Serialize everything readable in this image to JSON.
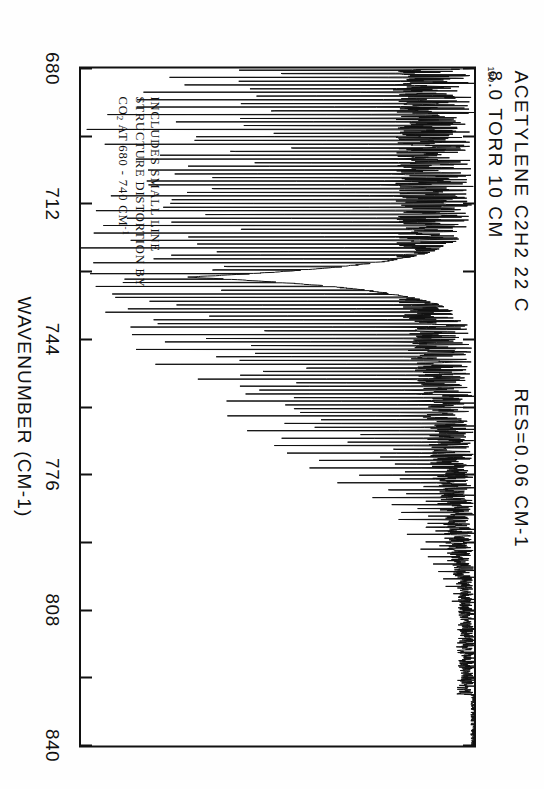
{
  "figure": {
    "kind": "infrared-absorption-spectrum",
    "orientation_degrees": 90,
    "ink_color": "#111111",
    "paper_color": "#fefefe"
  },
  "header": {
    "line1": "ACETYLENE  C2H2    22 C",
    "line2": "8.0 TORR  10 CM",
    "resolution": "RES=0.06 CM-1",
    "ymax_label": "130"
  },
  "annotation": {
    "line1": "INCLUDES SMALL LINE",
    "line2": "STRUCTURE DISTORTION BY",
    "line3_pre": "CO",
    "line3_sub": "2",
    "line3_mid": " AT 680 - 740 CM",
    "line3_sup": "-1"
  },
  "axis": {
    "title": "WAVENUMBER  (CM-1)",
    "tick_labels": [
      "680",
      "712",
      "744",
      "776",
      "808",
      "840"
    ]
  },
  "chart_data": {
    "type": "line",
    "title": "ACETYLENE  C2H2    22 C",
    "subtitle": "8.0 TORR  10 CM   RES=0.06 CM-1",
    "xlabel": "WAVENUMBER  (CM-1)",
    "ylabel": "",
    "xlim": [
      680,
      840
    ],
    "ylim": [
      0,
      130
    ],
    "xticks": [
      680,
      696,
      712,
      728,
      744,
      760,
      776,
      792,
      808,
      824,
      840
    ],
    "xtick_labels": [
      "680",
      "",
      "712",
      "",
      "744",
      "",
      "776",
      "",
      "808",
      "",
      "840"
    ],
    "grid": false,
    "legend": null,
    "baseline_value": 130,
    "features": [
      {
        "name": "P-branch manifold",
        "range": [
          680,
          727
        ],
        "description": "dense series of strong downward lines, many reaching near zero"
      },
      {
        "name": "Q-branch",
        "center": 729.0,
        "description": "very intense saturated band head reaching full absorption"
      },
      {
        "name": "R-branch manifold",
        "range": [
          731,
          800
        ],
        "description": "dense series of lines decaying in strength with wavenumber"
      },
      {
        "name": "weak high-J lines",
        "range": [
          800,
          830
        ],
        "description": "sparse weak lines on baseline"
      }
    ],
    "series": [
      {
        "name": "transmission",
        "x_start": 680,
        "x_end": 840,
        "n_points": 1600,
        "baseline": 130,
        "peaks": [
          {
            "x": 680.4,
            "depth": 118
          },
          {
            "x": 681.2,
            "depth": 96
          },
          {
            "x": 682.1,
            "depth": 104
          },
          {
            "x": 683.0,
            "depth": 88
          },
          {
            "x": 683.9,
            "depth": 122
          },
          {
            "x": 684.8,
            "depth": 75
          },
          {
            "x": 685.6,
            "depth": 110
          },
          {
            "x": 686.5,
            "depth": 92
          },
          {
            "x": 687.4,
            "depth": 126
          },
          {
            "x": 688.3,
            "depth": 80
          },
          {
            "x": 689.1,
            "depth": 115
          },
          {
            "x": 690.0,
            "depth": 100
          },
          {
            "x": 690.9,
            "depth": 124
          },
          {
            "x": 691.8,
            "depth": 86
          },
          {
            "x": 692.6,
            "depth": 112
          },
          {
            "x": 693.5,
            "depth": 98
          },
          {
            "x": 694.4,
            "depth": 128
          },
          {
            "x": 695.3,
            "depth": 84
          },
          {
            "x": 696.1,
            "depth": 118
          },
          {
            "x": 697.0,
            "depth": 103
          },
          {
            "x": 697.9,
            "depth": 125
          },
          {
            "x": 698.8,
            "depth": 90
          },
          {
            "x": 699.6,
            "depth": 120
          },
          {
            "x": 700.5,
            "depth": 106
          },
          {
            "x": 701.4,
            "depth": 127
          },
          {
            "x": 702.3,
            "depth": 94
          },
          {
            "x": 703.1,
            "depth": 121
          },
          {
            "x": 704.0,
            "depth": 108
          },
          {
            "x": 704.9,
            "depth": 128
          },
          {
            "x": 705.8,
            "depth": 97
          },
          {
            "x": 706.6,
            "depth": 123
          },
          {
            "x": 707.5,
            "depth": 110
          },
          {
            "x": 708.4,
            "depth": 129
          },
          {
            "x": 709.3,
            "depth": 99
          },
          {
            "x": 710.1,
            "depth": 124
          },
          {
            "x": 711.0,
            "depth": 112
          },
          {
            "x": 711.9,
            "depth": 129
          },
          {
            "x": 712.8,
            "depth": 102
          },
          {
            "x": 713.6,
            "depth": 125
          },
          {
            "x": 714.5,
            "depth": 114
          },
          {
            "x": 715.4,
            "depth": 130
          },
          {
            "x": 716.3,
            "depth": 104
          },
          {
            "x": 717.1,
            "depth": 126
          },
          {
            "x": 718.0,
            "depth": 116
          },
          {
            "x": 718.9,
            "depth": 130
          },
          {
            "x": 719.8,
            "depth": 106
          },
          {
            "x": 720.6,
            "depth": 127
          },
          {
            "x": 721.5,
            "depth": 118
          },
          {
            "x": 722.4,
            "depth": 130
          },
          {
            "x": 723.3,
            "depth": 108
          },
          {
            "x": 724.1,
            "depth": 128
          },
          {
            "x": 725.0,
            "depth": 120
          },
          {
            "x": 725.9,
            "depth": 130
          },
          {
            "x": 726.8,
            "depth": 124
          },
          {
            "x": 727.6,
            "depth": 130
          },
          {
            "x": 728.5,
            "depth": 130
          },
          {
            "x": 729.2,
            "depth": 130
          },
          {
            "x": 729.8,
            "depth": 130
          },
          {
            "x": 730.6,
            "depth": 130
          },
          {
            "x": 731.5,
            "depth": 128
          },
          {
            "x": 732.4,
            "depth": 126
          },
          {
            "x": 733.3,
            "depth": 124
          },
          {
            "x": 734.1,
            "depth": 122
          },
          {
            "x": 735.0,
            "depth": 120
          },
          {
            "x": 735.9,
            "depth": 125
          },
          {
            "x": 736.8,
            "depth": 115
          },
          {
            "x": 737.6,
            "depth": 122
          },
          {
            "x": 738.5,
            "depth": 112
          },
          {
            "x": 739.4,
            "depth": 120
          },
          {
            "x": 740.3,
            "depth": 108
          },
          {
            "x": 741.1,
            "depth": 118
          },
          {
            "x": 742.0,
            "depth": 104
          },
          {
            "x": 742.9,
            "depth": 116
          },
          {
            "x": 743.8,
            "depth": 100
          },
          {
            "x": 744.6,
            "depth": 114
          },
          {
            "x": 745.5,
            "depth": 96
          },
          {
            "x": 746.4,
            "depth": 112
          },
          {
            "x": 747.3,
            "depth": 92
          },
          {
            "x": 748.1,
            "depth": 110
          },
          {
            "x": 749.0,
            "depth": 88
          },
          {
            "x": 749.9,
            "depth": 108
          },
          {
            "x": 750.8,
            "depth": 84
          },
          {
            "x": 751.6,
            "depth": 105
          },
          {
            "x": 752.5,
            "depth": 80
          },
          {
            "x": 753.4,
            "depth": 102
          },
          {
            "x": 754.3,
            "depth": 76
          },
          {
            "x": 755.1,
            "depth": 99
          },
          {
            "x": 756.0,
            "depth": 72
          },
          {
            "x": 756.9,
            "depth": 96
          },
          {
            "x": 757.8,
            "depth": 68
          },
          {
            "x": 758.6,
            "depth": 92
          },
          {
            "x": 759.5,
            "depth": 64
          },
          {
            "x": 760.4,
            "depth": 88
          },
          {
            "x": 761.3,
            "depth": 60
          },
          {
            "x": 762.1,
            "depth": 84
          },
          {
            "x": 763.0,
            "depth": 56
          },
          {
            "x": 763.9,
            "depth": 80
          },
          {
            "x": 764.8,
            "depth": 52
          },
          {
            "x": 765.6,
            "depth": 76
          },
          {
            "x": 766.5,
            "depth": 48
          },
          {
            "x": 767.4,
            "depth": 72
          },
          {
            "x": 768.3,
            "depth": 44
          },
          {
            "x": 769.1,
            "depth": 68
          },
          {
            "x": 770.0,
            "depth": 40
          },
          {
            "x": 770.9,
            "depth": 64
          },
          {
            "x": 771.8,
            "depth": 36
          },
          {
            "x": 772.6,
            "depth": 58
          },
          {
            "x": 773.5,
            "depth": 33
          },
          {
            "x": 774.4,
            "depth": 54
          },
          {
            "x": 775.3,
            "depth": 30
          },
          {
            "x": 776.1,
            "depth": 50
          },
          {
            "x": 777.0,
            "depth": 27
          },
          {
            "x": 777.9,
            "depth": 46
          },
          {
            "x": 778.8,
            "depth": 24
          },
          {
            "x": 779.6,
            "depth": 42
          },
          {
            "x": 780.5,
            "depth": 22
          },
          {
            "x": 781.4,
            "depth": 38
          },
          {
            "x": 782.3,
            "depth": 20
          },
          {
            "x": 783.1,
            "depth": 34
          },
          {
            "x": 784.0,
            "depth": 18
          },
          {
            "x": 784.9,
            "depth": 31
          },
          {
            "x": 785.8,
            "depth": 16
          },
          {
            "x": 786.6,
            "depth": 28
          },
          {
            "x": 787.5,
            "depth": 15
          },
          {
            "x": 788.4,
            "depth": 25
          },
          {
            "x": 789.3,
            "depth": 13
          },
          {
            "x": 790.1,
            "depth": 22
          },
          {
            "x": 791.0,
            "depth": 12
          },
          {
            "x": 791.9,
            "depth": 20
          },
          {
            "x": 792.8,
            "depth": 11
          },
          {
            "x": 793.6,
            "depth": 18
          },
          {
            "x": 794.5,
            "depth": 10
          },
          {
            "x": 795.4,
            "depth": 16
          },
          {
            "x": 796.3,
            "depth": 9
          },
          {
            "x": 797.1,
            "depth": 14
          },
          {
            "x": 798.0,
            "depth": 8
          },
          {
            "x": 798.9,
            "depth": 12
          },
          {
            "x": 799.8,
            "depth": 7
          },
          {
            "x": 800.6,
            "depth": 11
          },
          {
            "x": 801.5,
            "depth": 6
          },
          {
            "x": 802.4,
            "depth": 9
          },
          {
            "x": 803.3,
            "depth": 5
          },
          {
            "x": 804.1,
            "depth": 8
          },
          {
            "x": 805.0,
            "depth": 5
          },
          {
            "x": 805.9,
            "depth": 7
          },
          {
            "x": 806.8,
            "depth": 4
          },
          {
            "x": 807.6,
            "depth": 6
          },
          {
            "x": 808.5,
            "depth": 4
          },
          {
            "x": 809.4,
            "depth": 5
          },
          {
            "x": 810.3,
            "depth": 3
          },
          {
            "x": 811.1,
            "depth": 4
          },
          {
            "x": 812.0,
            "depth": 3
          },
          {
            "x": 813.0,
            "depth": 4
          },
          {
            "x": 814.0,
            "depth": 2
          },
          {
            "x": 815.0,
            "depth": 3
          },
          {
            "x": 816.2,
            "depth": 2
          },
          {
            "x": 817.5,
            "depth": 3
          },
          {
            "x": 819.0,
            "depth": 2
          },
          {
            "x": 820.5,
            "depth": 2
          },
          {
            "x": 822.0,
            "depth": 2
          }
        ]
      }
    ]
  }
}
